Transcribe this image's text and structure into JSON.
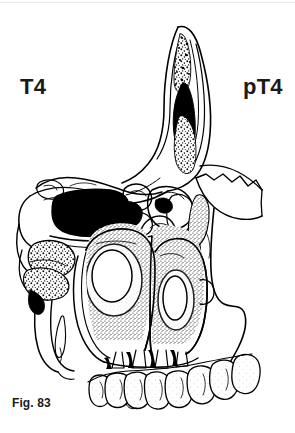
{
  "figure": {
    "caption": "Fig. 83",
    "left_label": "T4",
    "right_label": "pT4",
    "background_color": "#ffffff",
    "ink_color": "#000000",
    "text_color": "#1a1a1a"
  },
  "illustration": {
    "title": "paranasal-sinus-coronal-section",
    "description": "Black-and-white anatomical line drawing of a coronal section through the maxilla, nasal cavity, ethmoid air cells and orbit, showing a tumour mass and dentition",
    "regions": [
      {
        "name": "nasal-frontal-process",
        "shading": "stipple"
      },
      {
        "name": "tumour-mass-dark",
        "shading": "solid-black"
      },
      {
        "name": "ethmoid-air-cells",
        "shading": "outline"
      },
      {
        "name": "maxillary-sinus",
        "shading": "dense-stipple"
      },
      {
        "name": "inferior-turbinate",
        "shading": "stipple"
      },
      {
        "name": "zygomatic-suture",
        "shading": "serrated-line"
      },
      {
        "name": "upper-dentition",
        "shading": "light-stipple"
      },
      {
        "name": "lower-dentition",
        "shading": "light-stipple"
      }
    ]
  }
}
